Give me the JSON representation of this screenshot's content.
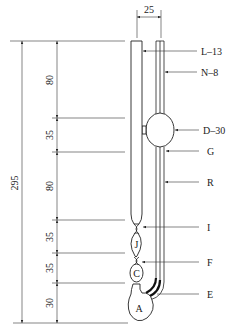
{
  "diagram": {
    "type": "technical-drawing",
    "width_dimension": {
      "value": "25"
    },
    "total_height_dimension": {
      "value": "295"
    },
    "segment_dimensions": [
      {
        "id": "seg1",
        "value": "80"
      },
      {
        "id": "seg2",
        "value": "35"
      },
      {
        "id": "seg3",
        "value": "80"
      },
      {
        "id": "seg4",
        "value": "35"
      },
      {
        "id": "seg5",
        "value": "35"
      },
      {
        "id": "seg6",
        "value": "30"
      }
    ],
    "callouts": [
      {
        "id": "L",
        "label": "L–13"
      },
      {
        "id": "N",
        "label": "N–8"
      },
      {
        "id": "D",
        "label": "D–30"
      },
      {
        "id": "G",
        "label": "G"
      },
      {
        "id": "R",
        "label": "R"
      },
      {
        "id": "I",
        "label": "I"
      },
      {
        "id": "F",
        "label": "F"
      },
      {
        "id": "E",
        "label": "E"
      }
    ],
    "bulb_labels": [
      {
        "id": "J",
        "label": "J"
      },
      {
        "id": "C",
        "label": "C"
      },
      {
        "id": "A",
        "label": "A"
      }
    ]
  }
}
